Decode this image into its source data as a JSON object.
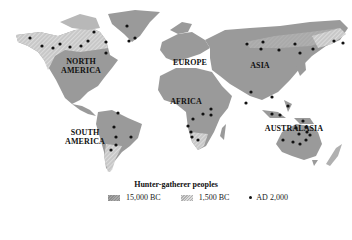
{
  "map": {
    "title": "Hunter-gatherer peoples",
    "colors": {
      "land_15000bc": "#9a9a9a",
      "land_1500bc_hatch": "#c4c4c4",
      "dot": "#111111",
      "background": "#ffffff"
    },
    "regions": [
      {
        "name": "NORTH AMERICA",
        "line1": "NORTH",
        "line2": "AMERICA"
      },
      {
        "name": "EUROPE",
        "line1": "EUROPE"
      },
      {
        "name": "ASIA",
        "line1": "ASIA"
      },
      {
        "name": "AFRICA",
        "line1": "AFRICA"
      },
      {
        "name": "SOUTH AMERICA",
        "line1": "SOUTH",
        "line2": "AMERICA"
      },
      {
        "name": "AUSTRALASIA",
        "line1": "AUSTRALASIA"
      }
    ],
    "legend": {
      "items": [
        {
          "label": "15,000 BC",
          "symbol": "solid-grey-swatch"
        },
        {
          "label": "1,500 BC",
          "symbol": "hatched-grey-swatch"
        },
        {
          "label": "AD 2,000",
          "symbol": "black-dot"
        }
      ]
    },
    "dot_counts": {
      "north_america": 13,
      "south_america": 6,
      "africa": 8,
      "asia": 13,
      "australasia": 12
    }
  }
}
